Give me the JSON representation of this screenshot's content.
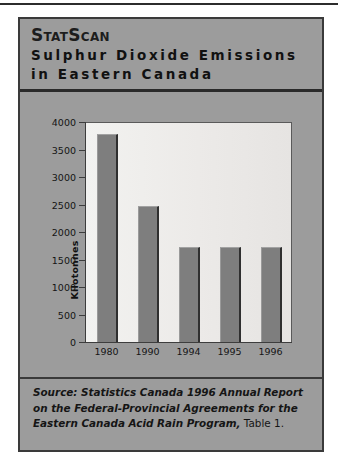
{
  "panel": {
    "brand": "StatScan",
    "subtitle": "Sulphur Dioxide Emissions in Eastern Canada",
    "subtitle_line1": "Sulphur Dioxide Emissions",
    "subtitle_line2": "in Eastern Canada",
    "background_color": "#9c9c9c",
    "border_color": "#3a3a3a"
  },
  "source_note": {
    "italic_text": "Source: Statistics Canada 1996 Annual Report on the Federal-Provincial Agreements for the Eastern Canada Acid Rain Program,",
    "plain_text": " Table 1."
  },
  "chart_data": {
    "type": "bar",
    "title": "Sulphur Dioxide Emissions in Eastern Canada",
    "categories": [
      "1980",
      "1990",
      "1994",
      "1995",
      "1996"
    ],
    "values": [
      3800,
      2500,
      1750,
      1750,
      1750
    ],
    "xlabel": "",
    "ylabel": "Kilotonnes",
    "ylim": [
      0,
      4000
    ],
    "yticks": [
      4000,
      3500,
      3000,
      2500,
      2000,
      1500,
      1000,
      500,
      0
    ],
    "ytick_labels": [
      "4000",
      "3500",
      "3000",
      "2500",
      "2000",
      "1500",
      "1000",
      "500",
      "0"
    ],
    "grid": false,
    "legend": "none",
    "bar_color": "#7e7e7e",
    "plot_background": "#efedeb"
  }
}
